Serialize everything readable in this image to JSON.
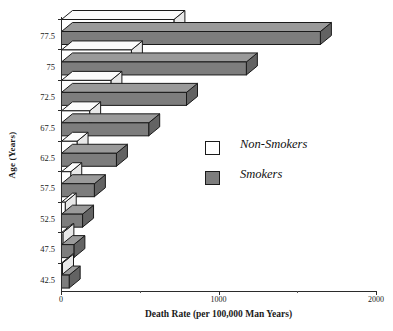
{
  "chart_data": {
    "type": "bar",
    "orientation": "horizontal",
    "style": "3d-stacked-offset",
    "title": "",
    "xlabel": "Death Rate (per 100,000 Man Years)",
    "ylabel": "Age (Years)",
    "categories": [
      "42.5",
      "47.5",
      "52.5",
      "57.5",
      "62.5",
      "67.5",
      "72.5",
      "75",
      "77.5"
    ],
    "categories_top_down": [
      "77.5",
      "75",
      "72.5",
      "67.5",
      "62.5",
      "57.5",
      "52.5",
      "47.5",
      "42.5"
    ],
    "series": [
      {
        "name": "Non-Smokers",
        "color": "#ffffff",
        "values_top_down": [
          720,
          450,
          320,
          185,
          105,
          65,
          30,
          15,
          10
        ]
      },
      {
        "name": "Smokers",
        "color": "#7d7d7d",
        "values_top_down": [
          1650,
          1180,
          800,
          560,
          355,
          215,
          140,
          85,
          55
        ]
      }
    ],
    "xlim": [
      0,
      2000
    ],
    "xticks": [
      0,
      1000,
      2000
    ],
    "xtick_labels": [
      "0",
      "1000",
      "2000"
    ],
    "xtick_minor": [
      500,
      1500
    ],
    "grid": false,
    "legend_position": "center-right"
  },
  "axes": {
    "y_title": "Age (Years)",
    "x_title": "Death Rate (per 100,000 Man Years)",
    "y_tick_labels": [
      "77.5",
      "75",
      "72.5",
      "67.5",
      "62.5",
      "57.5",
      "52.5",
      "47.5",
      "42.5"
    ],
    "x_tick_labels": [
      "0",
      "1000",
      "2000"
    ]
  },
  "legend": {
    "items": [
      {
        "label": "Non-Smokers",
        "swatch": "white-square-icon"
      },
      {
        "label": "Smokers",
        "swatch": "gray-square-icon"
      }
    ]
  },
  "caption_remnant": ""
}
